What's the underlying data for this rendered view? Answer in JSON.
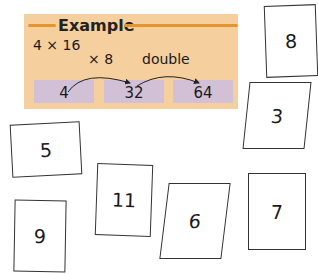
{
  "example": {
    "title": "Example",
    "expression": "4 × 16",
    "operations": [
      "× 8",
      "double"
    ],
    "steps": [
      "4",
      "32",
      "64"
    ],
    "colors": {
      "panel": "#f5cf9e",
      "wave": "#e8942c",
      "step_box": "#d2c0d6"
    }
  },
  "cards": [
    {
      "value": "8"
    },
    {
      "value": "3"
    },
    {
      "value": "5"
    },
    {
      "value": "11"
    },
    {
      "value": "6"
    },
    {
      "value": "7"
    },
    {
      "value": "9"
    }
  ]
}
